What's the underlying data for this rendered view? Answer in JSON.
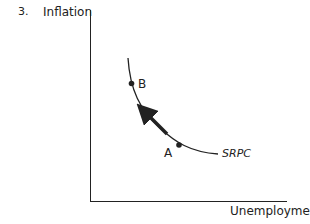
{
  "question_number": "3.",
  "axes": {
    "y_label": "Inflation",
    "x_label": "Unemployment"
  },
  "curve": {
    "label": "SRPC"
  },
  "points": [
    {
      "label": "B"
    },
    {
      "label": "A"
    }
  ],
  "arrow": {
    "direction": "from A toward B along SRPC"
  },
  "colors": {
    "ink": "#222222",
    "background": "#ffffff"
  }
}
